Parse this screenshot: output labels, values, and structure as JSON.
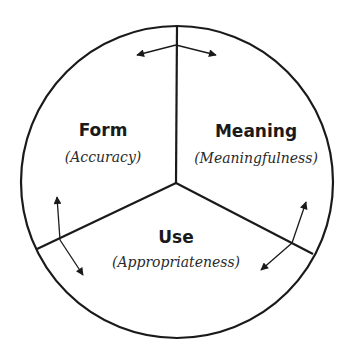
{
  "diagram": {
    "type": "circle-divided-into-three-sectors",
    "colors": {
      "stroke": "#1a1a1a",
      "background": "#ffffff"
    },
    "sectors": [
      {
        "id": "form",
        "title": "Form",
        "subtitle": "(Accuracy)"
      },
      {
        "id": "meaning",
        "title": "Meaning",
        "subtitle": "(Meaningfulness)"
      },
      {
        "id": "use",
        "title": "Use",
        "subtitle": "(Appropriateness)"
      }
    ],
    "arrows": [
      {
        "between": [
          "form",
          "meaning"
        ],
        "style": "double-headed"
      },
      {
        "between": [
          "form",
          "use"
        ],
        "style": "double-headed"
      },
      {
        "between": [
          "meaning",
          "use"
        ],
        "style": "double-headed"
      }
    ]
  }
}
